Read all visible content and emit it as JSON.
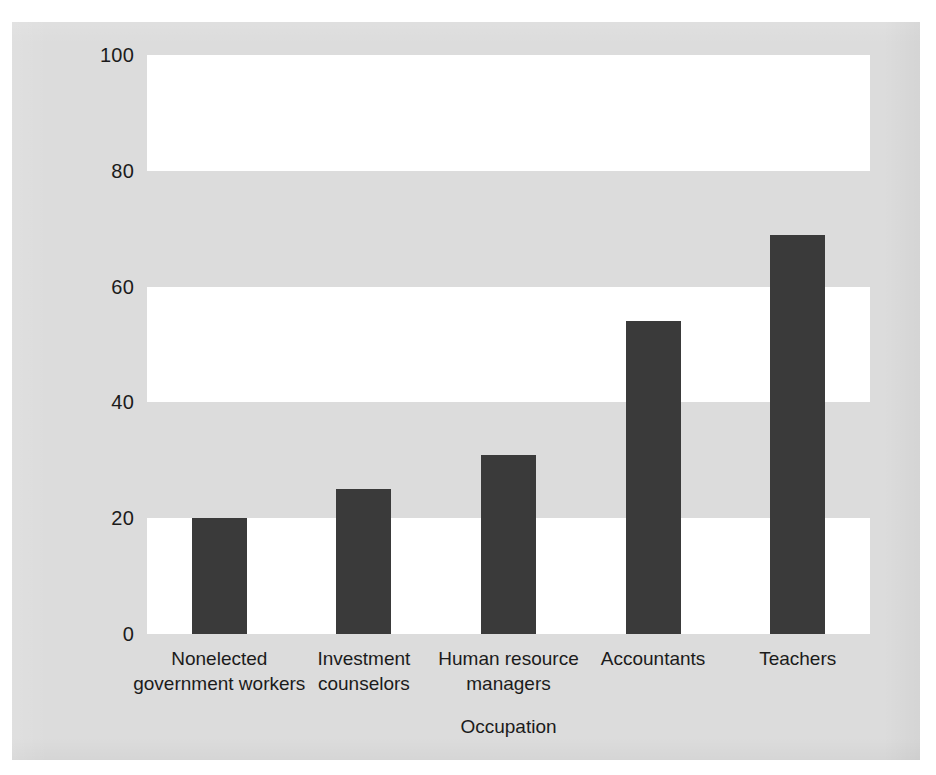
{
  "chart_data": {
    "type": "bar",
    "title": "",
    "subtitle": "",
    "xlabel": "Occupation",
    "ylabel": "Percentage Highly Credible",
    "categories": [
      "Nonelected\ngovernment workers",
      "Investment\ncounselors",
      "Human resource\nmanagers",
      "Accountants",
      "Teachers"
    ],
    "values": [
      20,
      25,
      31,
      54,
      69
    ],
    "ylim": [
      0,
      100
    ],
    "yticks": [
      0,
      20,
      40,
      60,
      80,
      100
    ],
    "ytick_labels": [
      "0",
      "20",
      "40",
      "60",
      "80",
      "100"
    ],
    "grid": false,
    "banded_background": true,
    "legend": null,
    "annotations": [],
    "colors": {
      "bar": "#3a3a3a",
      "background": "#dcdcdc",
      "band_light": "#ffffff",
      "band_dark": "#dcdcdc",
      "text": "#1b1b1b"
    }
  }
}
